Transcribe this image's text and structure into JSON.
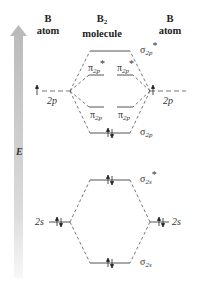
{
  "headers": {
    "left": {
      "line1": "B",
      "line2": "atom"
    },
    "center": {
      "line1": "B",
      "line1_sub": "2",
      "line2": "molecule"
    },
    "right": {
      "line1": "B",
      "line2": "atom"
    }
  },
  "energy_axis": {
    "label": "E",
    "direction": "up"
  },
  "atomic_orbitals": {
    "left": [
      {
        "name": "2p",
        "base": "2",
        "sub": "p",
        "electrons": "↑",
        "y": 91
      },
      {
        "name": "2s",
        "base": "2",
        "sub": "s",
        "electrons": "↑↓",
        "y": 222
      }
    ],
    "right": [
      {
        "name": "2p",
        "base": "2",
        "sub": "p",
        "electrons": "↑",
        "y": 91
      },
      {
        "name": "2s",
        "base": "2",
        "sub": "s",
        "electrons": "↑↓",
        "y": 222
      }
    ]
  },
  "molecular_orbitals": [
    {
      "name": "σ2p*",
      "symbol": "σ",
      "sub": "2p",
      "star": "*",
      "electrons": "",
      "y": 51
    },
    {
      "name": "π2p*",
      "symbol": "π",
      "sub": "2p",
      "star": "*",
      "electrons": "",
      "y": 75,
      "degenerate": 2
    },
    {
      "name": "π2p",
      "symbol": "π",
      "sub": "2p",
      "star": "",
      "electrons": "↑ ↑",
      "y": 107,
      "degenerate": 2
    },
    {
      "name": "σ2p",
      "symbol": "σ",
      "sub": "2p",
      "star": "",
      "electrons": "↑↓",
      "y": 133
    },
    {
      "name": "σ2s*",
      "symbol": "σ",
      "sub": "2s",
      "star": "*",
      "electrons": "↑↓",
      "y": 180
    },
    {
      "name": "σ2s",
      "symbol": "σ",
      "sub": "2s",
      "star": "",
      "electrons": "↑↓",
      "y": 263
    }
  ],
  "labels": {
    "sigma2p_star": "σ",
    "sigma2p_star_sub": "2p",
    "star": "*",
    "pi2p_star": "π",
    "pi2p_star_sub": "2p",
    "pi2p": "π",
    "pi2p_sub": "2p",
    "sigma2p": "σ",
    "sigma2p_sub": "2p",
    "sigma2s_star": "σ",
    "sigma2s_star_sub": "2s",
    "sigma2s": "σ",
    "sigma2s_sub": "2s",
    "left_2p": "2",
    "left_2p_sub": "p",
    "right_2p": "2",
    "right_2p_sub": "p",
    "left_2s": "2",
    "left_2s_sub": "s",
    "right_2s": "2",
    "right_2s_sub": "s"
  },
  "colors": {
    "arrow_top": "#b9b9b9",
    "arrow_bottom": "#f4f4f4",
    "line": "#555555"
  }
}
